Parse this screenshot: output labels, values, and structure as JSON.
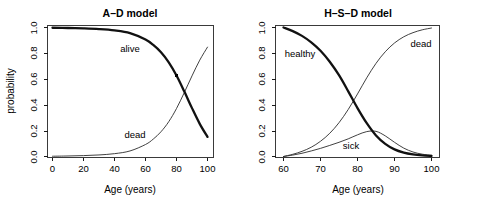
{
  "figure": {
    "background_color": "#ffffff",
    "panel_count": 2
  },
  "chart_data": [
    {
      "type": "line",
      "panel": "left",
      "title": "A–D model",
      "xlabel": "Age (years)",
      "ylabel": "probability",
      "xlim": [
        0,
        100
      ],
      "ylim": [
        0,
        1
      ],
      "xticks": [
        0,
        20,
        40,
        60,
        80,
        100
      ],
      "xtick_labels": [
        "0",
        "20",
        "40",
        "60",
        "80",
        "100"
      ],
      "yticks": [
        0.0,
        0.2,
        0.4,
        0.6,
        0.8,
        1.0
      ],
      "ytick_labels": [
        "0.0",
        "0.2",
        "0.4",
        "0.6",
        "0.8",
        "1.0"
      ],
      "grid": false,
      "legend": "inline-annotations",
      "x": [
        0,
        10,
        20,
        30,
        40,
        50,
        60,
        65,
        70,
        75,
        80,
        85,
        90,
        95,
        100
      ],
      "series": [
        {
          "name": "alive",
          "style": "thick",
          "annotation": "alive",
          "annotation_xy": [
            33,
            0.855
          ],
          "values": [
            0.998,
            0.996,
            0.993,
            0.988,
            0.978,
            0.957,
            0.907,
            0.865,
            0.808,
            0.73,
            0.628,
            0.505,
            0.375,
            0.253,
            0.152
          ]
        },
        {
          "name": "dead",
          "style": "thin",
          "annotation": "dead",
          "annotation_xy": [
            40,
            0.168
          ],
          "values": [
            0.002,
            0.004,
            0.007,
            0.012,
            0.022,
            0.043,
            0.093,
            0.135,
            0.192,
            0.27,
            0.372,
            0.495,
            0.625,
            0.747,
            0.848
          ]
        }
      ],
      "markers": [
        {
          "name": "alive-marker",
          "x": 80,
          "y": 0.628
        }
      ]
    },
    {
      "type": "line",
      "panel": "right",
      "title": "H–S–D model",
      "xlabel": "Age (years)",
      "ylabel": "",
      "xlim": [
        60,
        100
      ],
      "ylim": [
        0,
        1
      ],
      "xticks": [
        60,
        70,
        80,
        90,
        100
      ],
      "xtick_labels": [
        "60",
        "70",
        "80",
        "90",
        "100"
      ],
      "yticks": [
        0.0,
        0.2,
        0.4,
        0.6,
        0.8,
        1.0
      ],
      "ytick_labels": [
        "0.0",
        "0.2",
        "0.4",
        "0.6",
        "0.8",
        "1.0"
      ],
      "grid": false,
      "legend": "inline-annotations",
      "x": [
        60,
        62.5,
        65,
        67.5,
        70,
        72.5,
        75,
        77.5,
        80,
        82.5,
        85,
        87.5,
        90,
        92.5,
        95,
        97.5,
        100
      ],
      "series": [
        {
          "name": "healthy",
          "style": "thick",
          "annotation": "healthy",
          "annotation_xy": [
            62.6,
            0.795
          ],
          "values": [
            1.0,
            0.972,
            0.935,
            0.885,
            0.82,
            0.735,
            0.63,
            0.505,
            0.375,
            0.258,
            0.163,
            0.098,
            0.055,
            0.03,
            0.016,
            0.008,
            0.004
          ]
        },
        {
          "name": "dead",
          "style": "thin",
          "annotation": "dead",
          "annotation_xy": [
            92.5,
            0.835
          ],
          "values": [
            0.0,
            0.017,
            0.04,
            0.072,
            0.118,
            0.18,
            0.262,
            0.365,
            0.485,
            0.61,
            0.722,
            0.812,
            0.88,
            0.928,
            0.96,
            0.982,
            0.996
          ]
        },
        {
          "name": "sick",
          "style": "thin",
          "annotation": "sick",
          "annotation_xy": [
            80,
            0.075
          ],
          "values": [
            0.0,
            0.011,
            0.025,
            0.043,
            0.063,
            0.086,
            0.11,
            0.137,
            0.168,
            0.193,
            0.195,
            0.16,
            0.11,
            0.065,
            0.035,
            0.018,
            0.009
          ]
        }
      ],
      "markers": []
    }
  ],
  "left_panel": {
    "title": "A–D model",
    "ylabel": "probability",
    "xlabel": "Age (years)",
    "xtick_labels": [
      "0",
      "20",
      "40",
      "60",
      "80",
      "100"
    ],
    "ytick_labels": [
      "0.0",
      "0.2",
      "0.4",
      "0.6",
      "0.8",
      "1.0"
    ],
    "curve_labels": {
      "alive": "alive",
      "dead": "dead"
    }
  },
  "right_panel": {
    "title": "H–S–D model",
    "ylabel": "",
    "xlabel": "Age (years)",
    "xtick_labels": [
      "60",
      "70",
      "80",
      "90",
      "100"
    ],
    "ytick_labels": [
      "0.0",
      "0.2",
      "0.4",
      "0.6",
      "0.8",
      "1.0"
    ],
    "curve_labels": {
      "healthy": "healthy",
      "dead": "dead",
      "sick": "sick"
    }
  }
}
